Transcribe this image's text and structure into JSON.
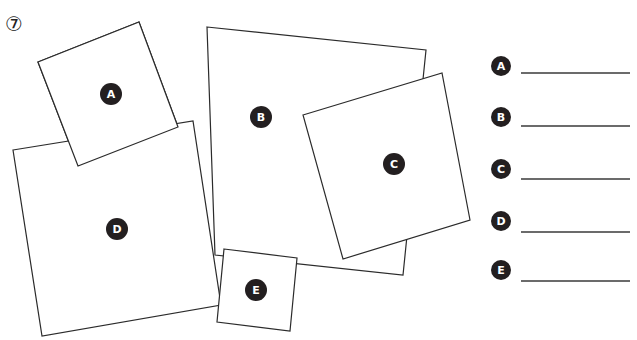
{
  "question": {
    "number_label": "⑦"
  },
  "shapes": [
    {
      "label": "A",
      "points": "38,62 139,22 178,127 78,166",
      "badge": [
        111,
        94
      ]
    },
    {
      "label": "B",
      "points": "207,27 426,50 403,275 215,255",
      "badge": [
        261,
        117
      ]
    },
    {
      "label": "D",
      "points": "13,150 193,121 221,305 42,336",
      "badge": [
        117,
        229
      ]
    },
    {
      "label": "C",
      "points": "303,115 442,73 470,220 343,259",
      "badge": [
        394,
        164
      ]
    },
    {
      "label": "E",
      "points": "224,249 297,258 290,331 217,322",
      "badge": [
        256,
        290
      ]
    }
  ],
  "answers": [
    {
      "label": "A",
      "value": ""
    },
    {
      "label": "B",
      "value": ""
    },
    {
      "label": "C",
      "value": ""
    },
    {
      "label": "D",
      "value": ""
    },
    {
      "label": "E",
      "value": ""
    }
  ],
  "colors": {
    "badge_fill": "#231f20",
    "stroke": "#2b2b2b",
    "background": "#ffffff"
  }
}
